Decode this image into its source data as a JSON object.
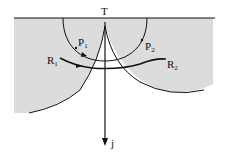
{
  "diagram": {
    "labels": {
      "top": "T",
      "p1": "P",
      "p1_sub": "1",
      "p2": "P",
      "p2_sub": "2",
      "r1": "R",
      "r1_sub": "1",
      "r2": "R",
      "r2_sub": "2",
      "axis": "j"
    },
    "colors": {
      "shade": "#dcdcdc",
      "stroke": "#111111",
      "background": "#ffffff"
    }
  }
}
